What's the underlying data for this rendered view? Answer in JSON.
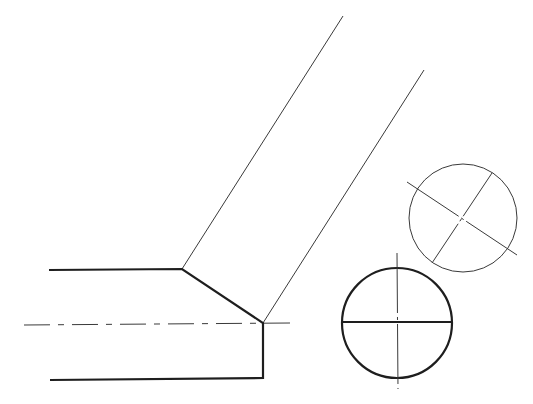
{
  "diagram": {
    "title": "Orthographic projection of a cylinder cut obliquely with auxiliary view",
    "colors": {
      "line": "#1e1e1e",
      "thin_line": "#3a3a3a",
      "background": "#ffffff"
    },
    "front_view": {
      "outline_points": [
        [
          49,
          270
        ],
        [
          182,
          269
        ],
        [
          263,
          323
        ],
        [
          263,
          378
        ],
        [
          50,
          380
        ]
      ],
      "centerline": {
        "x1": 24,
        "y1": 325,
        "x2": 290,
        "y2": 323,
        "dash": "26 8 6 8"
      }
    },
    "projection_lines": [
      {
        "x1": 182,
        "y1": 269,
        "x2": 343,
        "y2": 16
      },
      {
        "x1": 263,
        "y1": 323,
        "x2": 424,
        "y2": 70
      }
    ],
    "end_view_circle": {
      "cx": 397,
      "cy": 323,
      "r": 55,
      "hline": {
        "x1": 342,
        "y1": 322,
        "x2": 452,
        "y2": 322
      },
      "vline": {
        "x1": 397,
        "y1": 253,
        "x2": 398,
        "y2": 389
      }
    },
    "auxiliary_view_circle": {
      "cx": 463,
      "cy": 218,
      "r": 54,
      "axis_a": {
        "x1": 407,
        "y1": 182,
        "x2": 517,
        "y2": 255
      },
      "axis_b": {
        "x1": 492,
        "y1": 173,
        "x2": 432,
        "y2": 263
      }
    }
  }
}
